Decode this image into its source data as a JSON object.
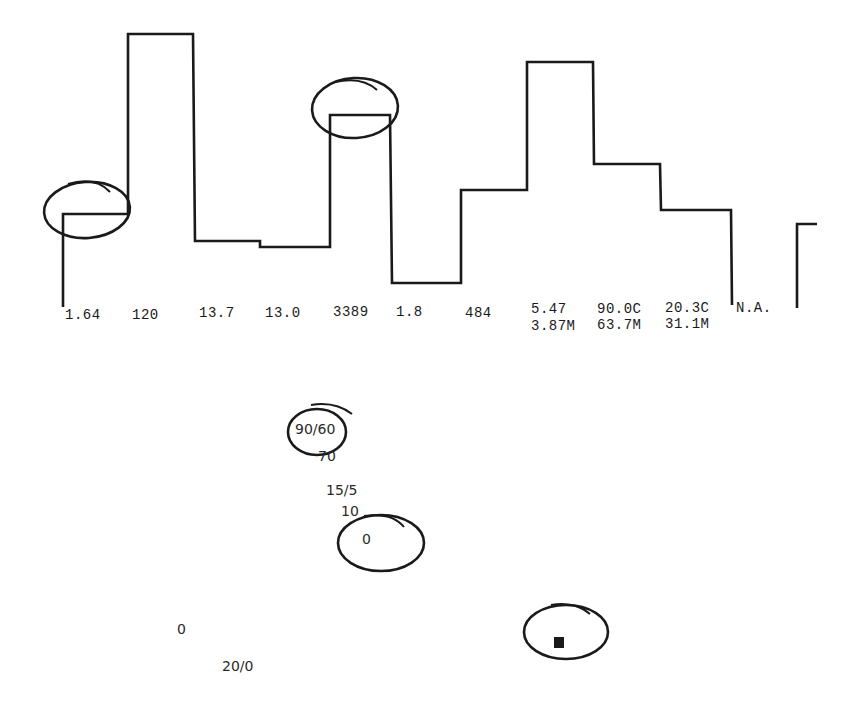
{
  "chart_data": {
    "type": "line",
    "subtype": "step",
    "title": "",
    "xlabel": "",
    "ylabel": "",
    "grid": false,
    "legend": null,
    "stroke_color": "#1a1a1a",
    "step_heights_px": [
      93,
      273,
      66,
      60,
      192,
      24,
      117,
      245,
      143,
      97
    ],
    "partial_segment_height_px": 84,
    "value_labels_row1": [
      "1.64",
      "120",
      "13.7",
      "13.0",
      "3389",
      "1.8",
      "484",
      "5.47",
      "90.0C",
      "20.3C",
      "N.A."
    ],
    "value_labels_row2": [
      "3.87M",
      "63.7M",
      "31.1M"
    ],
    "annotations": [
      {
        "type": "circle",
        "target": "step 1 (1.64)"
      },
      {
        "type": "circle",
        "target": "step 5 (3389)"
      },
      {
        "type": "circle",
        "target": "90/60"
      },
      {
        "type": "circle",
        "target": "0"
      },
      {
        "type": "circle",
        "target": "filled square marker"
      }
    ],
    "scatter_text": [
      "90/60",
      "70",
      "15/5",
      "10",
      "0",
      "0",
      "20/0"
    ]
  },
  "labels": {
    "row1": [
      {
        "text": "1.64",
        "x": 65,
        "y": 319
      },
      {
        "text": "120",
        "x": 132,
        "y": 319
      },
      {
        "text": "13.7",
        "x": 199,
        "y": 317
      },
      {
        "text": "13.0",
        "x": 265,
        "y": 317
      },
      {
        "text": "3389",
        "x": 333,
        "y": 316
      },
      {
        "text": "1.8",
        "x": 396,
        "y": 316
      },
      {
        "text": "484",
        "x": 465,
        "y": 317
      },
      {
        "text": "5.47",
        "x": 531,
        "y": 313
      },
      {
        "text": "90.0C",
        "x": 597,
        "y": 313
      },
      {
        "text": "20.3C",
        "x": 665,
        "y": 312
      },
      {
        "text": "N.A.",
        "x": 736,
        "y": 312
      }
    ],
    "row2": [
      {
        "text": "3.87M",
        "x": 531,
        "y": 330
      },
      {
        "text": "63.7M",
        "x": 597,
        "y": 329
      },
      {
        "text": "31.1M",
        "x": 665,
        "y": 328
      }
    ],
    "lower": [
      {
        "text": "90/60",
        "x": 295,
        "y": 433
      },
      {
        "text": "70",
        "x": 318,
        "y": 460
      },
      {
        "text": "15/5",
        "x": 326,
        "y": 494
      },
      {
        "text": "10",
        "x": 341,
        "y": 515
      },
      {
        "text": "0",
        "x": 362,
        "y": 543
      },
      {
        "text": "0",
        "x": 177,
        "y": 633
      },
      {
        "text": "20/0",
        "x": 222,
        "y": 670
      }
    ]
  }
}
